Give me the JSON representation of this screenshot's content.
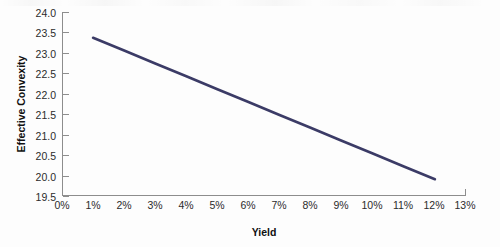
{
  "chart_data": {
    "type": "line",
    "title": "",
    "xlabel": "Yield",
    "ylabel": "Effective Convexity",
    "xlim": [
      0,
      13
    ],
    "ylim": [
      19.5,
      24.0
    ],
    "grid": false,
    "legend": "none",
    "x_tick_labels": [
      "0%",
      "1%",
      "2%",
      "3%",
      "4%",
      "5%",
      "6%",
      "7%",
      "8%",
      "9%",
      "10%",
      "11%",
      "12%",
      "13%"
    ],
    "x_tick_values": [
      0,
      1,
      2,
      3,
      4,
      5,
      6,
      7,
      8,
      9,
      10,
      11,
      12,
      13
    ],
    "y_tick_labels": [
      "24.0",
      "23.5",
      "23.0",
      "22.5",
      "22.0",
      "21.5",
      "21.0",
      "20.5",
      "20.0",
      "19.5"
    ],
    "y_tick_values": [
      24.0,
      23.5,
      23.0,
      22.5,
      22.0,
      21.5,
      21.0,
      20.5,
      20.0,
      19.5
    ],
    "series": [
      {
        "name": "Effective Convexity",
        "color": "#3b3b66",
        "x": [
          1,
          2,
          3,
          4,
          5,
          6,
          7,
          8,
          9,
          10,
          11,
          12
        ],
        "values": [
          23.37,
          23.06,
          22.74,
          22.43,
          22.11,
          21.8,
          21.48,
          21.17,
          20.85,
          20.54,
          20.22,
          19.91
        ]
      }
    ]
  },
  "colors": {
    "series_line": "#3b3b66",
    "axis": "#8d8d8d",
    "tick_text": "#2b2b2b",
    "axis_title": "#111111",
    "background": "#fdfdfd"
  }
}
